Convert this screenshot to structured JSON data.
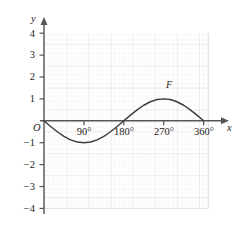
{
  "chart_data": {
    "type": "line",
    "title": "",
    "subtitle": "",
    "xlabel": "x",
    "ylabel": "y",
    "origin_label": "O",
    "grid": true,
    "grid_minor": true,
    "legend_position": "inline-curve-label",
    "xlim": [
      -20,
      400
    ],
    "ylim": [
      -4,
      4
    ],
    "x_unit": "degrees",
    "x_tick_labels": [
      "90°",
      "180°",
      "270°",
      "360°"
    ],
    "x_tick_values": [
      90,
      180,
      270,
      360
    ],
    "y_tick_labels": [
      "4",
      "3",
      "2",
      "1",
      "−1",
      "−2",
      "−3",
      "−4"
    ],
    "y_tick_values": [
      4,
      3,
      2,
      1,
      -1,
      -2,
      -3,
      -4
    ],
    "series": [
      {
        "name": "F",
        "label": "F",
        "equation": "y = -sin(x)",
        "color": "#3d3d3d",
        "x": [
          0,
          15,
          30,
          45,
          60,
          75,
          90,
          105,
          120,
          135,
          150,
          165,
          180,
          195,
          210,
          225,
          240,
          255,
          270,
          285,
          300,
          315,
          330,
          345,
          360
        ],
        "values": [
          0,
          -0.26,
          -0.5,
          -0.71,
          -0.87,
          -0.97,
          -1,
          -0.97,
          -0.87,
          -0.71,
          -0.5,
          -0.26,
          0,
          0.26,
          0.5,
          0.71,
          0.87,
          0.97,
          1,
          0.97,
          0.87,
          0.71,
          0.5,
          0.26,
          0
        ]
      }
    ],
    "annotations": [
      {
        "text": "F",
        "x": 280,
        "y": 1.55
      }
    ],
    "colors": {
      "curve": "#3d3d3d",
      "axis": "#555555",
      "grid_major": "#d9d0d4",
      "grid_minor": "#f0e8ec",
      "text": "#1d1d1d",
      "background": "#ffffff"
    }
  }
}
